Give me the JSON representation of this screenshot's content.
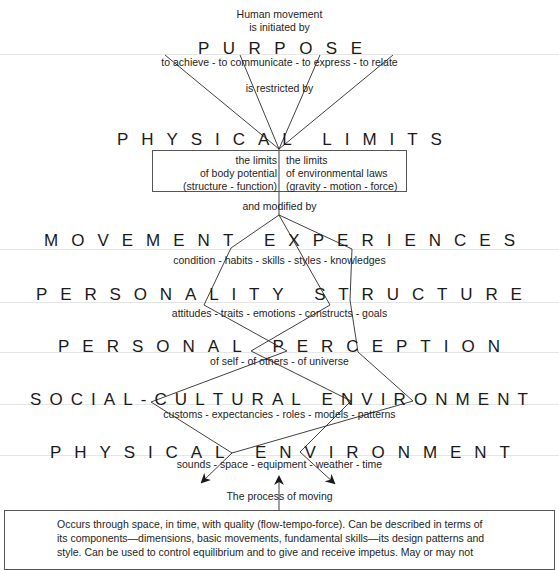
{
  "diagram": {
    "intro": {
      "line1": "Human movement",
      "line2": "is initiated by"
    },
    "purpose": {
      "heading": "PURPOSE",
      "subtext": "to achieve - to communicate - to express - to relate"
    },
    "connector_restricted": "is restricted by",
    "physical_limits": {
      "heading": "PHYSICAL LIMITS",
      "left": {
        "line1": "the limits",
        "line2": "of body potential",
        "line3": "(structure - function)"
      },
      "right": {
        "line1": "the limits",
        "line2": "of environmental laws",
        "line3": "(gravity - motion - force)"
      }
    },
    "connector_modified": "and modified by",
    "movement_experiences": {
      "heading": "MOVEMENT EXPERIENCES",
      "subtext": "condition - habits - skills - styles - knowledges"
    },
    "personality_structure": {
      "heading": "PERSONALITY STRUCTURE",
      "subtext": "attitudes - traits - emotions - constructs - goals"
    },
    "personal_perception": {
      "heading": "PERSONAL PERCEPTION",
      "subtext": "of self - of others - of universe"
    },
    "social_cultural_environment": {
      "heading": "SOCIAL-CULTURAL ENVIRONMENT",
      "subtext": "customs - expectancies - roles - models - patterns"
    },
    "physical_environment": {
      "heading": "PHYSICAL ENVIRONMENT",
      "subtext": "sounds - space - equipment - weather - time"
    },
    "process_label": "The process of moving",
    "process_box": {
      "line1": "Occurs through space, in time, with quality (flow-tempo-force). Can be described in terms of",
      "line2": "its components—dimensions, basic movements, fundamental skills—its design patterns and",
      "line3": "style. Can be used to control equilibrium and to give and receive impetus. May or may not"
    },
    "colors": {
      "line": "#2a2a2a",
      "text": "#1e1e1e",
      "background": "#ffffff"
    }
  }
}
